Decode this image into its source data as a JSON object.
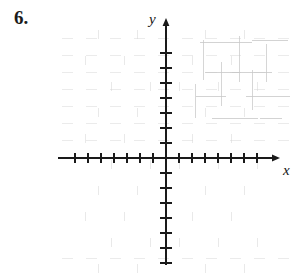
{
  "page": {
    "background_color": "#ffffff",
    "width": 305,
    "height": 278
  },
  "problem": {
    "number_label": "6."
  },
  "figure": {
    "kind": "blank-cartesian-coordinate-grid",
    "axis_color": "#1a1a1a",
    "tick_color": "#1a1a1a",
    "artifact_color": "#d8d8d8",
    "y_axis_label": "y",
    "x_axis_label": "x"
  },
  "chart_data": {
    "type": "scatter",
    "title": "",
    "xlabel": "x",
    "ylabel": "y",
    "x": [],
    "y": [],
    "series": [],
    "annotations": [],
    "grid": false,
    "legend": "none",
    "xlim": [
      -7,
      7
    ],
    "ylim": [
      -7,
      7
    ],
    "x_tick_values": [
      -7,
      -6,
      -5,
      -4,
      -3,
      -2,
      -1,
      1,
      2,
      3,
      4,
      5,
      6,
      7
    ],
    "y_tick_values": [
      -7,
      -6,
      -5,
      -4,
      -3,
      -2,
      -1,
      1,
      2,
      3,
      4,
      5,
      6,
      7
    ],
    "x_tick_labels": [],
    "y_tick_labels": [],
    "origin_px": [
      166,
      158
    ],
    "x_tick_spacing_px": 13,
    "y_tick_spacing_px": 15,
    "x_ticks_per_side": 7,
    "y_ticks_per_side": 7,
    "x_axis_extent_px": [
      58,
      280
    ],
    "y_axis_extent_px": [
      18,
      265
    ],
    "arrowheads": [
      "x-positive",
      "y-positive"
    ]
  }
}
